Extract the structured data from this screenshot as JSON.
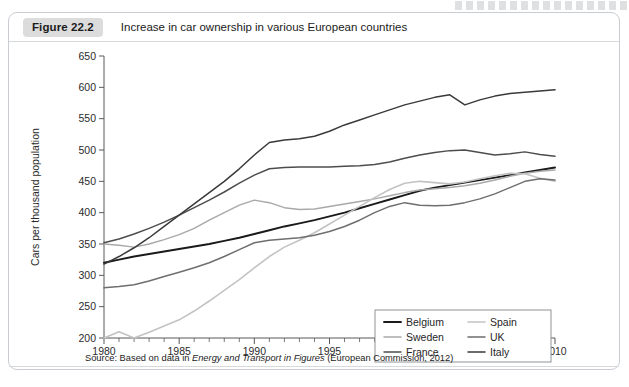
{
  "figure": {
    "badge": "Figure 22.2",
    "title": "Increase in car ownership in various European countries",
    "source_prefix": "Source: Based on data in ",
    "source_italic": "Energy and Transport in Figures",
    "source_suffix": " (European Commission, 2012)"
  },
  "chart_data": {
    "type": "line",
    "title": "Increase in car ownership in various European countries",
    "xlabel": "",
    "ylabel": "Cars per thousand population",
    "xlim": [
      1980,
      2010
    ],
    "ylim": [
      200,
      650
    ],
    "ytick_step": 50,
    "xtick_major_step": 5,
    "xtick_minor_step": 1,
    "grid": false,
    "legend_position": "inside bottom-right",
    "xticklabels": [
      "1980",
      "1985",
      "1990",
      "1995",
      "2000",
      "2005",
      "2010"
    ],
    "yticklabels": [
      "200",
      "250",
      "300",
      "350",
      "400",
      "450",
      "500",
      "550",
      "600",
      "650"
    ],
    "x": [
      1980,
      1981,
      1982,
      1983,
      1984,
      1985,
      1986,
      1987,
      1988,
      1989,
      1990,
      1991,
      1992,
      1993,
      1994,
      1995,
      1996,
      1997,
      1998,
      1999,
      2000,
      2001,
      2002,
      2003,
      2004,
      2005,
      2006,
      2007,
      2008,
      2009,
      2010
    ],
    "series": [
      {
        "name": "Belgium",
        "color": "#1a1a1a",
        "width": 1.9,
        "values": [
          320,
          325,
          330,
          334,
          338,
          342,
          346,
          350,
          355,
          360,
          366,
          372,
          378,
          383,
          388,
          394,
          400,
          407,
          414,
          421,
          428,
          435,
          440,
          444,
          448,
          452,
          456,
          460,
          464,
          468,
          472
        ]
      },
      {
        "name": "Sweden",
        "color": "#a9a9a9",
        "width": 1.5,
        "values": [
          350,
          348,
          345,
          350,
          357,
          365,
          375,
          388,
          400,
          412,
          420,
          416,
          408,
          405,
          406,
          410,
          414,
          418,
          422,
          427,
          432,
          436,
          438,
          440,
          443,
          447,
          452,
          458,
          463,
          466,
          468
        ]
      },
      {
        "name": "France",
        "color": "#4d4d4d",
        "width": 1.5,
        "values": [
          352,
          358,
          366,
          375,
          385,
          396,
          408,
          420,
          433,
          447,
          460,
          470,
          472,
          473,
          473,
          473,
          474,
          475,
          477,
          481,
          487,
          492,
          496,
          499,
          500,
          496,
          492,
          494,
          497,
          493,
          490
        ]
      },
      {
        "name": "Spain",
        "color": "#c3c3c3",
        "width": 1.6,
        "values": [
          200,
          210,
          200,
          209,
          219,
          229,
          243,
          259,
          276,
          293,
          312,
          330,
          345,
          356,
          368,
          382,
          396,
          410,
          424,
          437,
          447,
          450,
          448,
          446,
          449,
          454,
          459,
          463,
          462,
          455,
          450
        ]
      },
      {
        "name": "UK",
        "color": "#6e6e6e",
        "width": 1.5,
        "values": [
          280,
          282,
          285,
          291,
          298,
          305,
          312,
          320,
          330,
          341,
          352,
          356,
          358,
          360,
          364,
          370,
          378,
          388,
          400,
          410,
          416,
          412,
          411,
          412,
          416,
          422,
          430,
          440,
          450,
          454,
          452
        ]
      },
      {
        "name": "Italy",
        "color": "#3a3a3a",
        "width": 1.5,
        "values": [
          318,
          330,
          344,
          360,
          378,
          396,
          414,
          432,
          450,
          470,
          492,
          512,
          516,
          518,
          522,
          530,
          540,
          548,
          556,
          564,
          572,
          578,
          584,
          588,
          572,
          580,
          586,
          590,
          592,
          594,
          596
        ]
      }
    ],
    "legend_entries": [
      {
        "name": "Belgium",
        "color": "#1a1a1a",
        "width": 1.9,
        "column": "left"
      },
      {
        "name": "Sweden",
        "color": "#a9a9a9",
        "width": 1.5,
        "column": "left"
      },
      {
        "name": "France",
        "color": "#4d4d4d",
        "width": 1.5,
        "column": "left"
      },
      {
        "name": "Spain",
        "color": "#c3c3c3",
        "width": 1.6,
        "column": "right"
      },
      {
        "name": "UK",
        "color": "#6e6e6e",
        "width": 1.5,
        "column": "right"
      },
      {
        "name": "Italy",
        "color": "#3a3a3a",
        "width": 1.5,
        "column": "right"
      }
    ]
  }
}
